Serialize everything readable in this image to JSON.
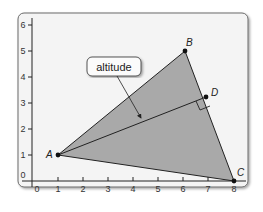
{
  "figure": {
    "type": "coordinate-geometry-diagram",
    "colors": {
      "frame_fill": "#f4f4f4",
      "frame_stroke": "#6b6b6b",
      "triangle_fill": "#a9a9a9",
      "line": "#222222",
      "text": "#333333"
    },
    "x_axis": {
      "ticks": [
        "0",
        "1",
        "2",
        "3",
        "4",
        "5",
        "6",
        "7",
        "8"
      ]
    },
    "y_axis": {
      "ticks": [
        "0",
        "1",
        "2",
        "3",
        "4",
        "5",
        "6"
      ]
    },
    "points": {
      "A": {
        "label": "A",
        "x": 1,
        "y": 1
      },
      "B": {
        "label": "B",
        "x": 6,
        "y": 5
      },
      "C": {
        "label": "C",
        "x": 8,
        "y": 0
      },
      "D": {
        "label": "D",
        "x": 6.7,
        "y": 3.2
      }
    },
    "callout": {
      "label": "altitude"
    }
  }
}
